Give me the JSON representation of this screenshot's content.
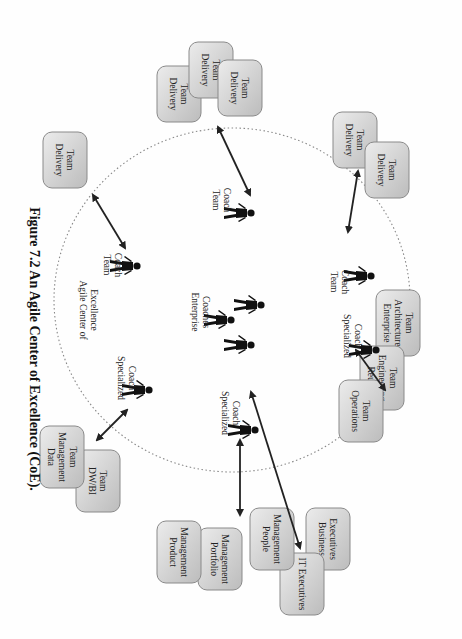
{
  "caption": "Figure 7.2 An Agile Center of Excellence (CoE).",
  "center_label": [
    "Agile Center of",
    "Excellence"
  ],
  "enterprise_coaches_label": [
    "Enterprise",
    "Coaches"
  ],
  "coaches": [
    {
      "id": "tc1",
      "label": [
        "Team",
        "Coach"
      ]
    },
    {
      "id": "tc2",
      "label": [
        "Team",
        "Coach"
      ]
    },
    {
      "id": "tc3",
      "label": [
        "Team",
        "Coach"
      ]
    },
    {
      "id": "sc1",
      "label": [
        "Specialized",
        "Coach"
      ]
    },
    {
      "id": "sc2",
      "label": [
        "Specialized",
        "Coach"
      ]
    },
    {
      "id": "sc3",
      "label": [
        "Specialized",
        "Coach"
      ]
    }
  ],
  "boxes": [
    {
      "id": "b1",
      "lines": [
        "Delivery",
        "Team"
      ]
    },
    {
      "id": "b2",
      "lines": [
        "Delivery",
        "Team"
      ]
    },
    {
      "id": "b3",
      "lines": [
        "Delivery",
        "Team"
      ]
    },
    {
      "id": "b4",
      "lines": [
        "Delivery",
        "Team"
      ]
    },
    {
      "id": "b5",
      "lines": [
        "Delivery",
        "Team"
      ]
    },
    {
      "id": "b6",
      "lines": [
        "Delivery",
        "Team"
      ]
    },
    {
      "id": "b7",
      "lines": [
        "Enterprise",
        "Architecture",
        "Team"
      ]
    },
    {
      "id": "b8",
      "lines": [
        "Reuse",
        "Engineering",
        "Team"
      ]
    },
    {
      "id": "b9",
      "lines": [
        "Operations",
        "Team"
      ]
    },
    {
      "id": "b10",
      "lines": [
        "Business",
        "Executives"
      ]
    },
    {
      "id": "b11",
      "lines": [
        "IT Executives"
      ]
    },
    {
      "id": "b12",
      "lines": [
        "People",
        "Management"
      ]
    },
    {
      "id": "b13",
      "lines": [
        "Portfolio",
        "Management"
      ]
    },
    {
      "id": "b14",
      "lines": [
        "Product",
        "Management"
      ]
    },
    {
      "id": "b15",
      "lines": [
        "DW/BI",
        "Team"
      ]
    },
    {
      "id": "b16",
      "lines": [
        "Data",
        "Management",
        "Team"
      ]
    }
  ],
  "colors": {
    "box_fill_light": "#e8e8e8",
    "box_fill_dark": "#bdbdbd",
    "box_stroke": "#8a8a8a",
    "arrow": "#222222",
    "circle": "#888888"
  }
}
